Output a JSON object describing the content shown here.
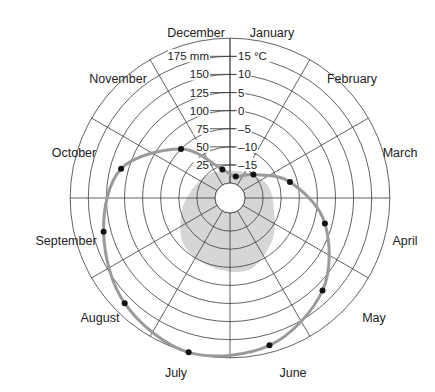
{
  "chart_data": {
    "type": "polar-climate",
    "title": "",
    "categories": [
      "January",
      "February",
      "March",
      "April",
      "May",
      "June",
      "July",
      "August",
      "September",
      "October",
      "November",
      "December"
    ],
    "series": [
      {
        "name": "Precipitation",
        "unit": "mm",
        "style": "shaded-area",
        "color": "#d6d6d6",
        "values": [
          18,
          25,
          35,
          42,
          62,
          82,
          78,
          70,
          48,
          32,
          24,
          18
        ]
      },
      {
        "name": "Temperature",
        "unit": "°C",
        "style": "line-with-points",
        "color": "#9a9a9a",
        "point_color": "#111111",
        "values": [
          -18,
          -15,
          -7,
          3,
          12,
          18,
          20,
          17,
          12,
          7,
          -5,
          -16
        ]
      }
    ],
    "radial_scales": {
      "precipitation": {
        "ticks": [
          25,
          50,
          75,
          100,
          125,
          150,
          175
        ],
        "labels": [
          "25",
          "50",
          "75",
          "100",
          "125",
          "150",
          "175 mm"
        ]
      },
      "temperature": {
        "ticks": [
          -15,
          -10,
          -5,
          0,
          5,
          10,
          15
        ],
        "labels": [
          "–15",
          "–10",
          "–5",
          "0",
          "5",
          "10",
          "15 °C"
        ]
      }
    },
    "rings": 9,
    "sectors": 12,
    "grid": true,
    "legend": "none"
  },
  "colors": {
    "grid": "#3a3a3a",
    "shade": "#d6d6d6",
    "line": "#9a9a9a",
    "points": "#111111",
    "text": "#222222"
  }
}
